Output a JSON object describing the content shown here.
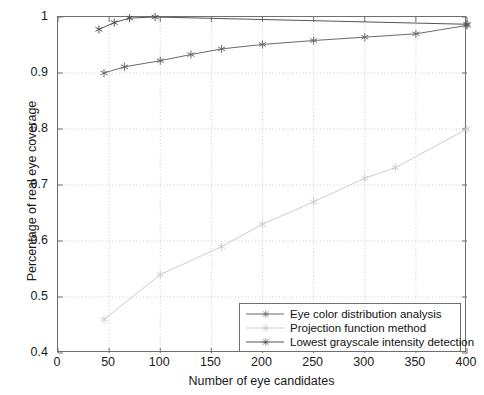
{
  "chart_data": {
    "type": "line",
    "title": "",
    "xlabel": "Number of eye candidates",
    "ylabel": "Percentage of real eye coverage",
    "xlim": [
      0,
      400
    ],
    "ylim": [
      0.4,
      1.0
    ],
    "xticks": [
      0,
      50,
      100,
      150,
      200,
      250,
      300,
      350,
      400
    ],
    "xticklabels": [
      "0",
      "50",
      "100",
      "150",
      "200",
      "250",
      "300",
      "350",
      "400"
    ],
    "yticks": [
      0.4,
      0.5,
      0.6,
      0.7,
      0.8,
      0.9,
      1.0
    ],
    "yticklabels": [
      "0.4",
      "0.5",
      "0.6",
      "0.7",
      "0.8",
      "0.9",
      "1"
    ],
    "grid": true,
    "grid_style": "dotted",
    "legend_position": "lower right",
    "series": [
      {
        "name": "Eye color distribution analysis",
        "color": "#6b6b6b",
        "marker": "asterisk",
        "x": [
          45,
          65,
          100,
          130,
          160,
          200,
          250,
          300,
          350,
          400
        ],
        "y": [
          0.9,
          0.911,
          0.922,
          0.933,
          0.943,
          0.951,
          0.958,
          0.964,
          0.97,
          0.985
        ]
      },
      {
        "name": "Projection function method",
        "color": "#cdcdcd",
        "marker": "asterisk",
        "x": [
          45,
          100,
          160,
          200,
          250,
          300,
          330,
          400
        ],
        "y": [
          0.46,
          0.54,
          0.59,
          0.63,
          0.67,
          0.712,
          0.731,
          0.8
        ]
      },
      {
        "name": "Lowest grayscale intensity detection",
        "color": "#555555",
        "marker": "asterisk",
        "x": [
          40,
          55,
          70,
          95,
          400
        ],
        "y": [
          0.978,
          0.99,
          0.998,
          1.0,
          0.987
        ]
      }
    ]
  },
  "axes": {
    "x_title": "Number of eye candidates",
    "y_title": "Percentage of real eye coverage"
  },
  "legend": {
    "items": [
      {
        "label": "Eye color distribution analysis",
        "color": "#6b6b6b",
        "marker": "✳"
      },
      {
        "label": "Projection function method",
        "color": "#cdcdcd",
        "marker": "✳"
      },
      {
        "label": "Lowest grayscale intensity detection",
        "color": "#555555",
        "marker": "✳"
      }
    ]
  }
}
